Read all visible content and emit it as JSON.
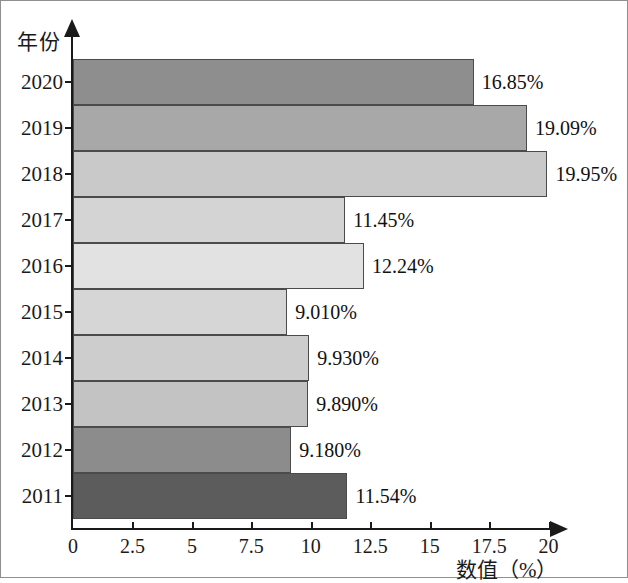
{
  "chart_data": {
    "type": "bar",
    "orientation": "horizontal",
    "title": "",
    "xlabel": "数值（%）",
    "ylabel": "年份",
    "categories": [
      "2020",
      "2019",
      "2018",
      "2017",
      "2016",
      "2015",
      "2014",
      "2013",
      "2012",
      "2011"
    ],
    "values": [
      16.85,
      19.09,
      19.95,
      11.45,
      12.24,
      9.01,
      9.93,
      9.89,
      9.18,
      11.54
    ],
    "data_labels": [
      "16.85%",
      "19.09%",
      "19.95%",
      "11.45%",
      "12.24%",
      "9.010%",
      "9.930%",
      "9.890%",
      "9.180%",
      "11.54%"
    ],
    "bar_colors": [
      "#8e8e8e",
      "#a8a8a8",
      "#c9c9c9",
      "#d4d4d4",
      "#e2e2e2",
      "#d6d6d6",
      "#cdcdcd",
      "#c3c3c3",
      "#8c8c8c",
      "#5c5c5c"
    ],
    "xlim": [
      0,
      22.5
    ],
    "xticks": [
      0,
      2.5,
      5,
      7.5,
      10,
      12.5,
      15,
      17.5,
      20
    ],
    "xtick_labels": [
      "0",
      "2.5",
      "5",
      "7.5",
      "10",
      "12.5",
      "15",
      "17.5",
      "20"
    ],
    "grid": false,
    "legend": "none",
    "axis_color": "#1a1a1a",
    "bar_border_color": "#4b4b4b",
    "frame_color": "#8f8f8f",
    "background": "#ffffff"
  },
  "axes": {
    "y_title": "年份",
    "x_title": "数值（%）"
  }
}
